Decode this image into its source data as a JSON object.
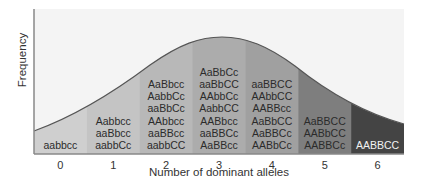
{
  "chart_data": {
    "type": "bar",
    "title": "",
    "xlabel": "Number of dominant alleles",
    "ylabel": "Frequency",
    "categories": [
      "0",
      "1",
      "2",
      "3",
      "4",
      "5",
      "6"
    ],
    "values": [
      1,
      6,
      15,
      20,
      15,
      6,
      1
    ],
    "genotypes": [
      [
        "aabbcc"
      ],
      [
        "Aabbcc",
        "aaBbcc",
        "aabbCc"
      ],
      [
        "AaBbcc",
        "AabbCc",
        "aaBbCc",
        "AAbbcc",
        "aaBBcc",
        "aabbCC"
      ],
      [
        "AaBbCc",
        "aaBbCC",
        "AAbbCc",
        "AabbCC",
        "AABbcc",
        "aaBBCc",
        "AaBBcc"
      ],
      [
        "aaBBCC",
        "AAbbCC",
        "AABBcc",
        "AaBbCC",
        "AaBBCc",
        "AABbCc"
      ],
      [
        "AaBBCC",
        "AABbCC",
        "AABBCc"
      ],
      [
        "AABBCC"
      ]
    ],
    "column_colors": [
      "#cfcfcf",
      "#c4c4c4",
      "#b8b8b8",
      "#acacac",
      "#a0a0a0",
      "#7e7e7e",
      "#444444"
    ],
    "curve": "normal distribution overlay",
    "grid": false,
    "legend": "none"
  }
}
